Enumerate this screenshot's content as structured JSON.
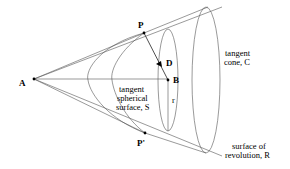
{
  "figure": {
    "points": {
      "A": "A",
      "P": "P",
      "P_prime": "P'",
      "D": "D",
      "B": "B",
      "r": "r"
    },
    "labels": {
      "tangent_cone": [
        "tangent",
        "cone, C"
      ],
      "tangent_sphere": [
        "tangent",
        "spherical",
        "surface, S"
      ],
      "surface_revolution": [
        "surface of",
        "revolution, R"
      ]
    }
  }
}
